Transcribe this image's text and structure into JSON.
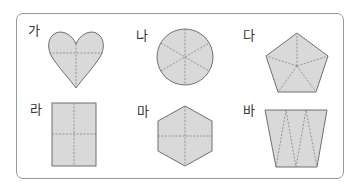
{
  "colors": {
    "fill": "#d9d9d9",
    "stroke": "#6f6f6f",
    "dash": "#8a8a8a",
    "frame": "#9a9a9a"
  },
  "figures": [
    {
      "label": "가",
      "shape": "heart",
      "division": "4 parts (cross)"
    },
    {
      "label": "나",
      "shape": "circle",
      "division": "6 parts (sectors)"
    },
    {
      "label": "다",
      "shape": "pentagon",
      "division": "5 parts (center to vertices)"
    },
    {
      "label": "라",
      "shape": "rectangle",
      "division": "4 parts (cross)"
    },
    {
      "label": "마",
      "shape": "hexagon",
      "division": "4 parts (cross)"
    },
    {
      "label": "바",
      "shape": "trapezoid",
      "division": "5 triangles (zigzag)"
    }
  ]
}
